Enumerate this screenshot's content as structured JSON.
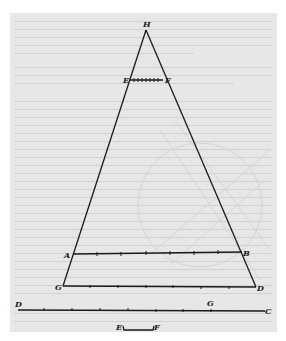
{
  "figure": {
    "colors": {
      "page_background": "#e7e7e7",
      "margin": "#ffffff",
      "ink": "#1a1a1a",
      "bleed_through": "#cfcfcf"
    },
    "labels": {
      "apex": "H",
      "upper_left": "E",
      "upper_right": "F",
      "mid_left": "A",
      "mid_right": "B",
      "base_left": "G",
      "base_right": "D",
      "line_left": "D",
      "line_mark": "G",
      "line_right": "C",
      "bracket_left": "E",
      "bracket_right": "F"
    },
    "points": {
      "H": [
        146,
        28
      ],
      "E": [
        129,
        79
      ],
      "F": [
        164,
        79
      ],
      "A": [
        72,
        254
      ],
      "B": [
        243,
        252
      ],
      "G": [
        63,
        286
      ],
      "D": [
        256,
        287
      ],
      "line_D": [
        18,
        310
      ],
      "line_C": [
        265,
        311
      ],
      "line_G": [
        211,
        310
      ],
      "bracket_E": [
        123,
        327
      ],
      "bracket_F": [
        153,
        327
      ]
    },
    "segments": {
      "EF_divisions": 8,
      "AB_divisions": 7,
      "GD_divisions": 7,
      "DC_divisions": 9
    }
  }
}
